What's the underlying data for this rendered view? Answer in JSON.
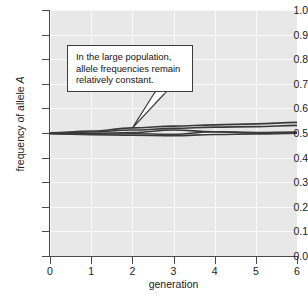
{
  "figure": {
    "background_color": "#ffffff",
    "plot_background_color": "#e8e8e8",
    "gridline_color": "#fafafa",
    "axis_color": "#4a4a4a",
    "line_color": "#3a3a3a"
  },
  "annotation": {
    "text": "In the large population,\nallele frequencies remain\nrelatively constant.",
    "border_color": "#3c3c3c",
    "fill_color": "#ffffff",
    "pointer_target_x": 2.0,
    "pointer_target_y": 0.52
  },
  "chart_data": {
    "type": "line",
    "title": "",
    "subtitle": "",
    "xlabel": "generation",
    "ylabel": "frequency of allele A",
    "xlim": [
      0,
      6
    ],
    "ylim": [
      0.0,
      1.0
    ],
    "grid": true,
    "legend_position": "none",
    "xticks": [
      0,
      1,
      2,
      3,
      4,
      5,
      6
    ],
    "xtick_labels": [
      "0",
      "1",
      "2",
      "3",
      "4",
      "5",
      "6"
    ],
    "yticks": [
      0.0,
      0.1,
      0.2,
      0.3,
      0.4,
      0.5,
      0.6,
      0.7,
      0.8,
      0.9,
      1.0
    ],
    "ytick_labels": [
      "0.0",
      "0.1",
      "0.2",
      "0.3",
      "0.4",
      "0.5",
      "0.6",
      "0.7",
      "0.8",
      "0.9",
      "1.0"
    ],
    "x": [
      0,
      1,
      2,
      3,
      4,
      5,
      6
    ],
    "series": [
      {
        "name": "population 1",
        "values": [
          0.5,
          0.508,
          0.521,
          0.528,
          0.533,
          0.537,
          0.543
        ]
      },
      {
        "name": "population 2",
        "values": [
          0.501,
          0.504,
          0.512,
          0.519,
          0.524,
          0.526,
          0.531
        ]
      },
      {
        "name": "population 3",
        "values": [
          0.499,
          0.498,
          0.502,
          0.512,
          0.505,
          0.502,
          0.504
        ]
      },
      {
        "name": "population 4",
        "values": [
          0.498,
          0.495,
          0.497,
          0.495,
          0.505,
          0.499,
          0.501
        ]
      },
      {
        "name": "population 5",
        "values": [
          0.497,
          0.493,
          0.491,
          0.489,
          0.494,
          0.496,
          0.499
        ]
      }
    ]
  }
}
